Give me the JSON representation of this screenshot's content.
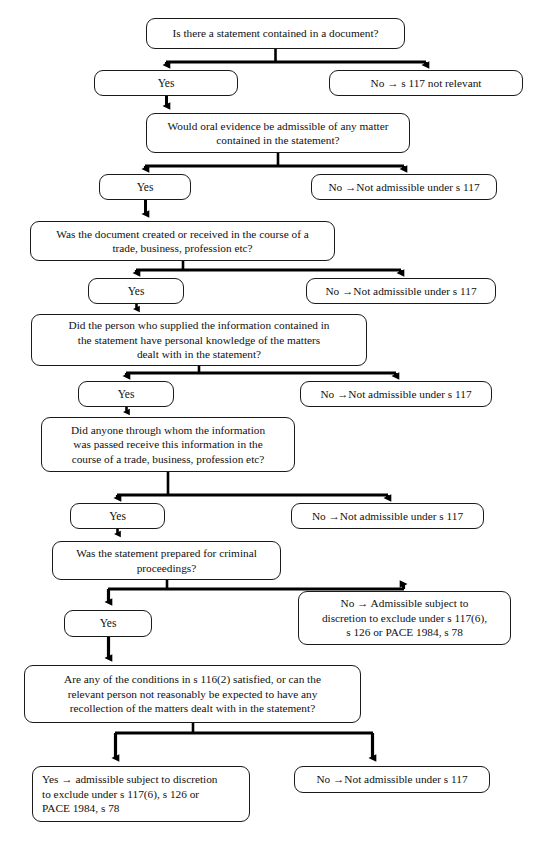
{
  "diagram": {
    "style": {
      "box_border": "#1a1a1a",
      "box_fill": "#ffffff",
      "connector": "#000000",
      "text": "#111111"
    },
    "nodes": [
      {
        "id": "q1",
        "role": "question",
        "text": "Is there a statement contained in a document?",
        "x": 146,
        "y": 18,
        "w": 259,
        "h": 31
      },
      {
        "id": "q1-yes",
        "role": "answer-yes",
        "text": "Yes",
        "x": 94,
        "y": 70,
        "w": 144,
        "h": 26
      },
      {
        "id": "q1-no",
        "role": "answer-no",
        "text": "No → s 117 not relevant",
        "x": 329,
        "y": 70,
        "w": 194,
        "h": 26
      },
      {
        "id": "q2",
        "role": "question",
        "text": "Would oral evidence be admissible of any matter\ncontained in the statement?",
        "x": 146,
        "y": 113,
        "w": 264,
        "h": 40
      },
      {
        "id": "q2-yes",
        "role": "answer-yes",
        "text": "Yes",
        "x": 99,
        "y": 174,
        "w": 92,
        "h": 26
      },
      {
        "id": "q2-no",
        "role": "answer-no",
        "text": "No →Not admissible under s 117",
        "x": 311,
        "y": 174,
        "w": 186,
        "h": 26
      },
      {
        "id": "q3",
        "role": "question",
        "text": "Was the document created or received in the course of a\ntrade, business, profession etc?",
        "x": 30,
        "y": 221,
        "w": 305,
        "h": 40
      },
      {
        "id": "q3-yes",
        "role": "answer-yes",
        "text": "Yes",
        "x": 88,
        "y": 278,
        "w": 96,
        "h": 26
      },
      {
        "id": "q3-no",
        "role": "answer-no",
        "text": "No →Not admissible under s 117",
        "x": 306,
        "y": 278,
        "w": 190,
        "h": 26
      },
      {
        "id": "q4",
        "role": "question",
        "text": "Did the person who supplied the information contained in\nthe statement have personal knowledge of the matters\ndealt with in the statement?",
        "x": 31,
        "y": 314,
        "w": 336,
        "h": 52
      },
      {
        "id": "q4-yes",
        "role": "answer-yes",
        "text": "Yes",
        "x": 78,
        "y": 381,
        "w": 96,
        "h": 26
      },
      {
        "id": "q4-no",
        "role": "answer-no",
        "text": "No →Not admissible under s 117",
        "x": 300,
        "y": 381,
        "w": 192,
        "h": 26
      },
      {
        "id": "q5",
        "role": "question",
        "text": "Did anyone through whom the information\nwas passed receive this information in the\ncourse of a trade, business, profession etc?",
        "x": 41,
        "y": 417,
        "w": 254,
        "h": 55
      },
      {
        "id": "q5-yes",
        "role": "answer-yes",
        "text": "Yes",
        "x": 70,
        "y": 503,
        "w": 95,
        "h": 26
      },
      {
        "id": "q5-no",
        "role": "answer-no",
        "text": "No →Not admissible under s 117",
        "x": 291,
        "y": 503,
        "w": 193,
        "h": 26
      },
      {
        "id": "q6",
        "role": "question",
        "text": "Was the statement prepared for criminal\nproceedings?",
        "x": 52,
        "y": 541,
        "w": 229,
        "h": 39
      },
      {
        "id": "q6-yes",
        "role": "answer-yes",
        "text": "Yes",
        "x": 64,
        "y": 610,
        "w": 88,
        "h": 27
      },
      {
        "id": "q6-no",
        "role": "answer-no",
        "text": "No → Admissible subject to\ndiscretion to exclude under s 117(6),\ns 126 or PACE 1984, s 78",
        "x": 298,
        "y": 591,
        "w": 213,
        "h": 54
      },
      {
        "id": "q7",
        "role": "question",
        "text": "Are any of the conditions in s 116(2) satisfied, or can the\nrelevant person not reasonably be expected to have any\nrecollection of the matters dealt with in the statement?",
        "x": 24,
        "y": 665,
        "w": 337,
        "h": 58
      },
      {
        "id": "q7-yes",
        "role": "answer-yes",
        "text": "Yes → admissible subject to discretion\nto exclude under s 117(6), s 126 or\nPACE 1984, s 78",
        "x": 32,
        "y": 766,
        "w": 218,
        "h": 56
      },
      {
        "id": "q7-no",
        "role": "answer-no",
        "text": "No →Not admissible under s 117",
        "x": 294,
        "y": 766,
        "w": 196,
        "h": 27
      }
    ],
    "edges": [
      {
        "from": "q1",
        "to": "q1-yes",
        "kind": "split-left"
      },
      {
        "from": "q1",
        "to": "q1-no",
        "kind": "split-right"
      },
      {
        "from": "q1-yes",
        "to": "q2",
        "kind": "straight"
      },
      {
        "from": "q2",
        "to": "q2-yes",
        "kind": "split-left"
      },
      {
        "from": "q2",
        "to": "q2-no",
        "kind": "split-right"
      },
      {
        "from": "q2-yes",
        "to": "q3",
        "kind": "straight"
      },
      {
        "from": "q3",
        "to": "q3-yes",
        "kind": "split-left"
      },
      {
        "from": "q3",
        "to": "q3-no",
        "kind": "split-right"
      },
      {
        "from": "q3-yes",
        "to": "q4",
        "kind": "straight"
      },
      {
        "from": "q4",
        "to": "q4-yes",
        "kind": "split-left"
      },
      {
        "from": "q4",
        "to": "q4-no",
        "kind": "split-right"
      },
      {
        "from": "q4-yes",
        "to": "q5",
        "kind": "straight"
      },
      {
        "from": "q5",
        "to": "q5-yes",
        "kind": "split-left"
      },
      {
        "from": "q5",
        "to": "q5-no",
        "kind": "split-right"
      },
      {
        "from": "q5-yes",
        "to": "q6",
        "kind": "straight"
      },
      {
        "from": "q6",
        "to": "q6-yes",
        "kind": "split-left"
      },
      {
        "from": "q6",
        "to": "q6-no",
        "kind": "split-right"
      },
      {
        "from": "q6-yes",
        "to": "q7",
        "kind": "straight"
      },
      {
        "from": "q7",
        "to": "q7-yes",
        "kind": "split-left"
      },
      {
        "from": "q7",
        "to": "q7-no",
        "kind": "split-right"
      }
    ]
  }
}
